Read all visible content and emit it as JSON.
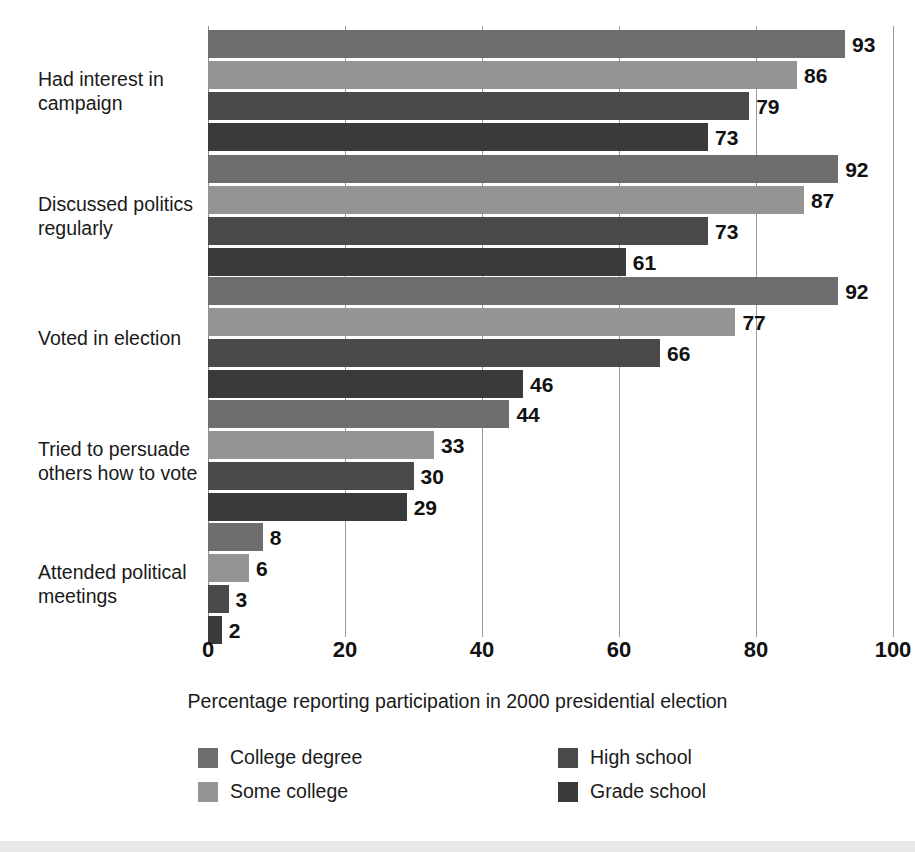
{
  "chart_data": {
    "type": "bar",
    "orientation": "horizontal",
    "title": "",
    "xlabel": "Percentage reporting participation in 2000 presidential election",
    "ylabel": "",
    "xlim": [
      0,
      100
    ],
    "xticks": [
      0,
      20,
      40,
      60,
      80,
      100
    ],
    "xtick_labels": [
      "0",
      "20",
      "40",
      "60",
      "80",
      "100"
    ],
    "grid": true,
    "grid_axis": "x",
    "legend_position": "bottom",
    "categories": [
      "Had interest in campaign",
      "Discussed politics regularly",
      "Voted in election",
      "Tried to persuade others how to vote",
      "Attended political meetings"
    ],
    "category_lines": [
      [
        "Had interest in",
        "campaign"
      ],
      [
        "Discussed politics",
        "regularly"
      ],
      [
        "Voted in election"
      ],
      [
        "Tried to persuade",
        "others how to vote"
      ],
      [
        "Attended political",
        "meetings"
      ]
    ],
    "series": [
      {
        "name": "College degree",
        "color": "#6e6e6e",
        "values": [
          93,
          92,
          92,
          44,
          8
        ]
      },
      {
        "name": "Some college",
        "color": "#949494",
        "values": [
          86,
          87,
          77,
          33,
          6
        ]
      },
      {
        "name": "High school",
        "color": "#4a4a4a",
        "values": [
          79,
          73,
          66,
          30,
          3
        ]
      },
      {
        "name": "Grade school",
        "color": "#3a3a3a",
        "values": [
          73,
          61,
          46,
          29,
          2
        ]
      }
    ]
  },
  "legend": {
    "entries": [
      {
        "label": "College degree",
        "color": "#6e6e6e",
        "column": 0,
        "row": 0
      },
      {
        "label": "Some college",
        "color": "#949494",
        "column": 0,
        "row": 1
      },
      {
        "label": "High school",
        "color": "#4a4a4a",
        "column": 1,
        "row": 0
      },
      {
        "label": "Grade school",
        "color": "#3a3a3a",
        "column": 1,
        "row": 1
      }
    ]
  },
  "colors": {
    "background": "#ffffff",
    "text": "#1a1a1a",
    "gridline": "#9a9a9a",
    "bottom_band": "#e8e8e8"
  }
}
